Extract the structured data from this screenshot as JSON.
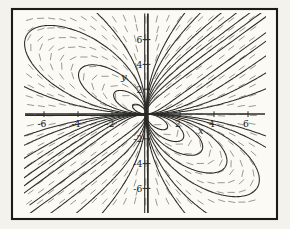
{
  "figure": {
    "kind": "direction-field-with-solution-curves",
    "background_color": "#f3f2ed",
    "paper_color": "#fbfaf5",
    "frame_color": "#1b1b19",
    "curve_color": "#2b2b28",
    "field_dash_color": "#8f8d84",
    "label_color": "#21211f"
  },
  "chart_data": {
    "type": "line",
    "title": "",
    "xlabel": "x",
    "ylabel": "y",
    "xlim": [
      -7,
      7.1
    ],
    "ylim": [
      -8.1,
      8.1
    ],
    "grid": false,
    "legend": false,
    "x_tick_values": [
      -6,
      -4,
      -2,
      2,
      4,
      6
    ],
    "x_tick_labels": [
      "-6",
      "-4",
      "-2",
      "2",
      "4",
      "6"
    ],
    "y_tick_values": [
      6,
      4,
      2,
      -2,
      -4,
      -6
    ],
    "y_tick_labels": [
      "6",
      "4",
      "2",
      "-2",
      "-4",
      "-6"
    ],
    "ode": "dy/dx = y(y^3+2x^3)/(x(x^3+2y^3))",
    "solution_family": "x^3 - y^3 + 3cxy = 0",
    "curve_c_values": [
      0.8,
      1.4,
      2.1,
      3.0,
      4.2,
      6.5,
      9.5,
      -0.5,
      -1.2,
      -2.5,
      -4.5,
      -8
    ],
    "field_grid": {
      "x_start": 30,
      "x_end": 263,
      "x_step": 10.6,
      "y_start": 19,
      "y_end": 209,
      "y_step": 9.6,
      "dash_half_len": 3.2
    }
  },
  "plot_mapping": {
    "origin_px": [
      146,
      114
    ],
    "px_per_x_unit": 17,
    "px_per_y_unit": 12.4,
    "frame_rect": [
      12,
      9,
      265,
      210
    ],
    "clip_rect": [
      24,
      13,
      242,
      200
    ],
    "x_label_pos": [
      198,
      134
    ],
    "y_label_pos": [
      121,
      80
    ]
  }
}
